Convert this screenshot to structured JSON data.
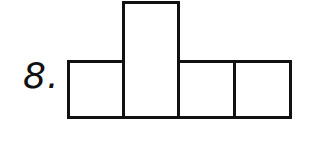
{
  "problem": {
    "number_label": "8.",
    "figure": {
      "description": "Net of squares: a row of four squares with the second square extended upward (double height)",
      "shapes": [
        {
          "id": "box-1",
          "type": "square",
          "position": "row-1"
        },
        {
          "id": "box-2",
          "type": "rectangle",
          "position": "row-2",
          "note": "double height, extends upward"
        },
        {
          "id": "box-3",
          "type": "square",
          "position": "row-3"
        },
        {
          "id": "box-4",
          "type": "square",
          "position": "row-4"
        }
      ],
      "stroke_color": "#111111",
      "fill_color": "#ffffff"
    }
  }
}
